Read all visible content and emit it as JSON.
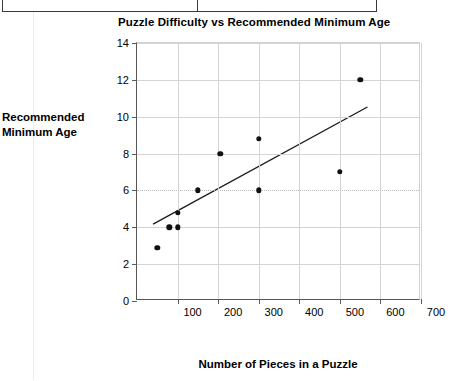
{
  "document_fragment": {
    "note": "partial table border visible at top edge",
    "cells": [
      "",
      ""
    ]
  },
  "chart_data": {
    "type": "scatter",
    "title": "Puzzle Difficulty vs Recommended Minimum Age",
    "xlabel": "Number of Pieces in a Puzzle",
    "ylabel": "Recommended Minimum Age",
    "ylabel_lines": [
      "Recommended",
      "Minimum Age"
    ],
    "xlim": [
      0,
      700
    ],
    "ylim": [
      0,
      14
    ],
    "xticks": [
      0,
      100,
      200,
      300,
      400,
      500,
      600,
      700
    ],
    "xticklabels": [
      "",
      "100",
      "200",
      "300",
      "400",
      "500",
      "600",
      "700"
    ],
    "yticks": [
      0,
      2,
      4,
      6,
      8,
      10,
      12,
      14
    ],
    "yticklabels": [
      "0",
      "2",
      "4",
      "6",
      "8",
      "10",
      "12",
      "14"
    ],
    "grid": true,
    "grid_axis": "both",
    "dotted_gridline_y": 6,
    "legend": false,
    "marker": "filled-circle",
    "marker_color": "#111111",
    "points": [
      {
        "x": 50,
        "y": 2.9
      },
      {
        "x": 80,
        "y": 4.0
      },
      {
        "x": 100,
        "y": 4.0
      },
      {
        "x": 100,
        "y": 4.8
      },
      {
        "x": 150,
        "y": 6.0
      },
      {
        "x": 205,
        "y": 8.0
      },
      {
        "x": 300,
        "y": 8.8
      },
      {
        "x": 300,
        "y": 6.0
      },
      {
        "x": 500,
        "y": 7.0
      },
      {
        "x": 550,
        "y": 12.0
      }
    ],
    "trendline": {
      "type": "linear",
      "x0": 40,
      "y0": 4.1,
      "x1": 572,
      "y1": 10.5,
      "color": "#1c1c1c"
    }
  }
}
